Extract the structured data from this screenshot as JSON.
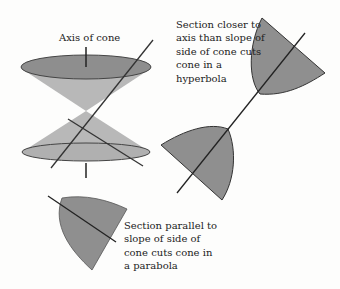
{
  "labels": {
    "axis": "Axis of cone",
    "hyperbola": "Section closer to\naxis than slope of\nside of cone cuts\ncone in a\nhyperbola",
    "parabola": "Section parallel to\nslope of side of\ncone cuts cone in\na parabola"
  },
  "colors": {
    "cone_fill": "#b5b5b5",
    "ellipse_fill": "#8d8d8d",
    "section_fill": "#8f8f8f",
    "line": "#2a2a2a"
  }
}
